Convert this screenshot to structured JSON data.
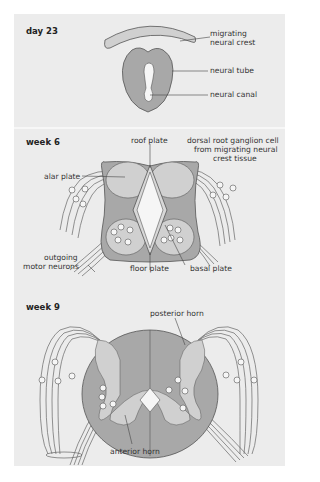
{
  "panels": [
    {
      "stage": "day 23",
      "labels": {
        "crest_1": "migrating",
        "crest_2": "neural crest",
        "tube": "neural tube",
        "canal": "neural canal"
      }
    },
    {
      "stage": "week 6",
      "labels": {
        "roof": "roof plate",
        "drg_1": "dorsal root ganglion cell",
        "drg_2": "from migrating neural",
        "drg_3": "crest tissue",
        "alar": "alar plate",
        "motor_1": "outgoing",
        "motor_2": "motor neurons",
        "floor": "floor plate",
        "basal": "basal plate"
      }
    },
    {
      "stage": "week 9",
      "labels": {
        "posterior": "posterior horn",
        "anterior": "anterior horn"
      }
    }
  ],
  "colors": {
    "panel_bg": "#ececec",
    "dark_fill": "#a8a8a8",
    "light_fill": "#d0d0d0",
    "white_fill": "#f6f6f6",
    "stroke": "#555555"
  }
}
